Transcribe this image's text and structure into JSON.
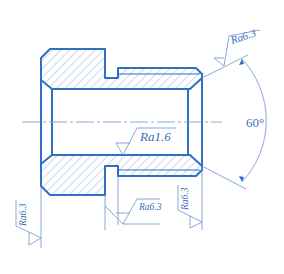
{
  "drawing": {
    "title": "Bushing cross-section with surface roughness annotations",
    "colors": {
      "outline": "#2f6fc4",
      "hatch": "#7aa2d6",
      "thin": "#6b93cf",
      "text": "#3a6fb8"
    },
    "centerline": {
      "y": 122
    },
    "angle": {
      "label": "60°"
    },
    "roughness": [
      {
        "id": "top-right",
        "label": "Ra6.3"
      },
      {
        "id": "bore",
        "label": "Ra1.6"
      },
      {
        "id": "groove",
        "label": "Ra6.3"
      },
      {
        "id": "left-face",
        "label": "Ra6.3"
      },
      {
        "id": "right-face",
        "label": "Ra6.3"
      }
    ]
  }
}
